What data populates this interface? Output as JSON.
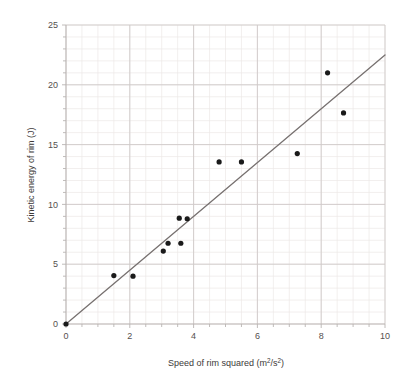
{
  "chart_data": {
    "type": "scatter",
    "title": "",
    "xlabel": "Speed of rim squared (m2/s2)",
    "xlabel_parts": {
      "lead": "Speed of rim squared (m",
      "sup1": "2",
      "mid": "/s",
      "sup2": "2",
      "tail": ")"
    },
    "ylabel": "Kinetic energy of rim (J)",
    "xlim": [
      0,
      10
    ],
    "ylim": [
      0,
      25
    ],
    "x_ticks": [
      0,
      2,
      4,
      6,
      8,
      10
    ],
    "x_tick_labels": [
      "0",
      "2",
      "4",
      "6",
      "8",
      "10"
    ],
    "x_minor_step": 0.5,
    "y_ticks": [
      0,
      5,
      10,
      15,
      20,
      25
    ],
    "y_tick_labels": [
      "0",
      "5",
      "10",
      "15",
      "20",
      "25"
    ],
    "y_minor_step": 1,
    "grid": true,
    "legend": "none",
    "points": [
      {
        "x": 0.0,
        "y": 0.0
      },
      {
        "x": 1.5,
        "y": 4.05
      },
      {
        "x": 2.1,
        "y": 4.0
      },
      {
        "x": 3.05,
        "y": 6.1
      },
      {
        "x": 3.2,
        "y": 6.75
      },
      {
        "x": 3.6,
        "y": 6.75
      },
      {
        "x": 3.55,
        "y": 8.85
      },
      {
        "x": 3.8,
        "y": 8.8
      },
      {
        "x": 4.8,
        "y": 13.55
      },
      {
        "x": 5.5,
        "y": 13.55
      },
      {
        "x": 7.25,
        "y": 14.25
      },
      {
        "x": 8.2,
        "y": 21.0
      },
      {
        "x": 8.7,
        "y": 17.65
      }
    ],
    "trend_line": {
      "from": {
        "x": 0.0,
        "y": 0.0
      },
      "to": {
        "x": 10.0,
        "y": 22.5
      },
      "slope": 2.25,
      "intercept": 0.0
    },
    "colors": {
      "point": "#1a1a1a",
      "trend_line": "#777170",
      "axis": "#b9b4b2",
      "grid_major": "#cfcac8",
      "grid_minor": "#ece8e6",
      "text": "#55504e",
      "background": "#ffffff"
    }
  }
}
